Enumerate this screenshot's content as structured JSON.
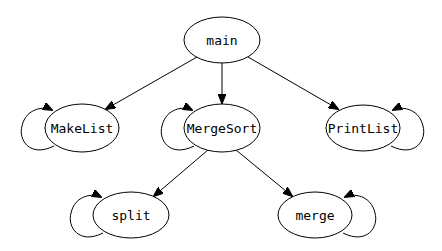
{
  "diagram": {
    "type": "call-graph",
    "nodes": [
      {
        "id": "main",
        "label": "main",
        "cx": 222,
        "cy": 40,
        "rx": 38,
        "ry": 23
      },
      {
        "id": "MakeList",
        "label": "MakeList",
        "cx": 82,
        "cy": 128,
        "rx": 37,
        "ry": 24
      },
      {
        "id": "MergeSort",
        "label": "MergeSort",
        "cx": 222,
        "cy": 128,
        "rx": 38,
        "ry": 24
      },
      {
        "id": "PrintList",
        "label": "PrintList",
        "cx": 363,
        "cy": 128,
        "rx": 37,
        "ry": 23
      },
      {
        "id": "split",
        "label": "split",
        "cx": 131,
        "cy": 215,
        "rx": 38,
        "ry": 23
      },
      {
        "id": "merge",
        "label": "merge",
        "cx": 315,
        "cy": 215,
        "rx": 37,
        "ry": 23
      }
    ],
    "edges": [
      {
        "from": "main",
        "to": "MakeList"
      },
      {
        "from": "main",
        "to": "MergeSort"
      },
      {
        "from": "main",
        "to": "PrintList"
      },
      {
        "from": "MergeSort",
        "to": "split"
      },
      {
        "from": "MergeSort",
        "to": "merge"
      },
      {
        "from": "MakeList",
        "to": "MakeList",
        "self_loop": "left"
      },
      {
        "from": "MergeSort",
        "to": "MergeSort",
        "self_loop": "left"
      },
      {
        "from": "PrintList",
        "to": "PrintList",
        "self_loop": "right"
      },
      {
        "from": "split",
        "to": "split",
        "self_loop": "left"
      },
      {
        "from": "merge",
        "to": "merge",
        "self_loop": "right"
      }
    ]
  },
  "labels": {
    "main": "main",
    "MakeList": "MakeList",
    "MergeSort": "MergeSort",
    "PrintList": "PrintList",
    "split": "split",
    "merge": "merge"
  }
}
